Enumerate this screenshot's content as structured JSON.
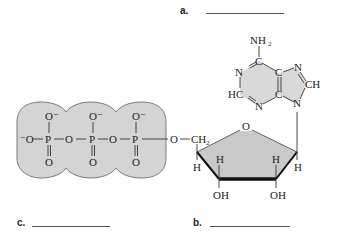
{
  "figure": {
    "type": "molecular structure diagram",
    "molecule_parts": [
      "triphosphate group",
      "ribose sugar",
      "adenine base"
    ]
  },
  "blanks": [
    {
      "id": "a",
      "label": "a.",
      "x": 180,
      "y": 6,
      "line_x": 206,
      "line_w": 78,
      "line_y": 13
    },
    {
      "id": "b",
      "label": "b.",
      "x": 193,
      "y": 218,
      "line_x": 210,
      "line_w": 80,
      "line_y": 226
    },
    {
      "id": "c",
      "label": "c.",
      "x": 16,
      "y": 218,
      "line_x": 32,
      "line_w": 78,
      "line_y": 226
    }
  ],
  "phosphates": {
    "fill": "#d4d4d4",
    "stroke": "#6e6e6e",
    "terminal_oxygen": "⁻O",
    "groups": [
      {
        "p": "P",
        "top": "O⁻",
        "bottom": "O"
      },
      {
        "p": "P",
        "top": "O⁻",
        "bottom": "O"
      },
      {
        "p": "P",
        "top": "O⁻",
        "bottom": "O"
      }
    ],
    "bridge_oxygens": [
      "O",
      "O"
    ],
    "ester_oxygen": "O"
  },
  "ribose": {
    "fill": "#c9c9c9",
    "ring_oxygen": "O",
    "ch2": "CH",
    "ch2_sub": "2",
    "hydrogens": [
      "H",
      "H",
      "H",
      "H"
    ],
    "hydroxyls": [
      "OH",
      "OH"
    ]
  },
  "adenine": {
    "fill": "#d9d9d9",
    "amine": "NH",
    "amine_sub": "2",
    "atoms": {
      "c6": "C",
      "n1": "N",
      "c2": "HC",
      "n3": "N",
      "c4": "C",
      "c5": "C",
      "n7": "N",
      "c8": "CH",
      "n9": "N"
    }
  }
}
